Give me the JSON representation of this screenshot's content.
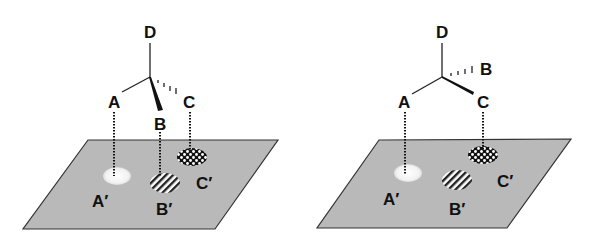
{
  "figure": {
    "panels": [
      {
        "id": "left",
        "substituents": {
          "top": "D",
          "left_plain": "A",
          "wedge": "B",
          "hashed": "C"
        },
        "projections": [
          {
            "atom": "A",
            "label": "A′",
            "pattern": "stippled-white"
          },
          {
            "atom": "B",
            "label": "B′",
            "pattern": "diagonal-stripes"
          },
          {
            "atom": "C",
            "label": "C′",
            "pattern": "checkerboard"
          }
        ]
      },
      {
        "id": "right",
        "substituents": {
          "top": "D",
          "left_plain": "A",
          "wedge": "C",
          "hashed": "B"
        },
        "projections": [
          {
            "atom": "A",
            "label": "A′",
            "pattern": "stippled-white"
          },
          {
            "atom": "B",
            "label": "B′",
            "pattern": "diagonal-stripes"
          },
          {
            "atom": "C",
            "label": "C′",
            "pattern": "checkerboard"
          }
        ]
      }
    ],
    "labels": {
      "D": "D",
      "A": "A",
      "B": "B",
      "C": "C",
      "A_prime": "A′",
      "B_prime": "B′",
      "C_prime": "C′"
    },
    "colors": {
      "plane": "#b9b9b9",
      "ink": "#111111"
    }
  }
}
